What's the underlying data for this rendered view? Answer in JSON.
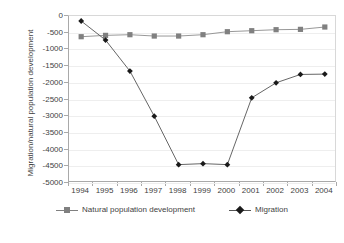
{
  "chart_data": {
    "type": "line",
    "title": "",
    "xlabel": "",
    "ylabel": "Migration/natural population development",
    "categories": [
      "1994",
      "1995",
      "1996",
      "1997",
      "1998",
      "1999",
      "2000",
      "2001",
      "2002",
      "2003",
      "2004"
    ],
    "ylim": [
      -5000,
      0
    ],
    "ytick_step": 500,
    "yticks": [
      "0",
      "-500",
      "-1000",
      "-1500",
      "-2000",
      "-2500",
      "-3000",
      "-3500",
      "-4000",
      "-4500",
      "-5000"
    ],
    "grid": true,
    "legend_position": "bottom",
    "series": [
      {
        "name": "Natural population development",
        "marker": "square",
        "color": "#808080",
        "values": [
          -620,
          -580,
          -560,
          -600,
          -600,
          -560,
          -470,
          -440,
          -410,
          -400,
          -330
        ]
      },
      {
        "name": "Migration",
        "marker": "diamond",
        "color": "#1a1a1a",
        "values": [
          -150,
          -720,
          -1650,
          -3000,
          -4450,
          -4420,
          -4450,
          -2450,
          -2000,
          -1750,
          -1740
        ]
      }
    ]
  },
  "axis": {
    "y_title": "Migration/natural population development"
  },
  "legend": {
    "items": [
      {
        "label": "Natural population development",
        "key": "square-marker-key"
      },
      {
        "label": "Migration",
        "key": "diamond-marker-key"
      }
    ]
  }
}
